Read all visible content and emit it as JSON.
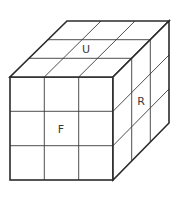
{
  "diagram": {
    "title": "",
    "type": "rubiks-cube-3x3-isometric",
    "grid_size": 3,
    "colors": {
      "stroke": "#2b2b2b",
      "background": "#ffffff",
      "label": "#3a3a3a"
    },
    "faces": [
      {
        "id": "U",
        "label": "U",
        "name": "up-face"
      },
      {
        "id": "F",
        "label": "F",
        "name": "front-face"
      },
      {
        "id": "R",
        "label": "R",
        "name": "right-face"
      }
    ]
  }
}
